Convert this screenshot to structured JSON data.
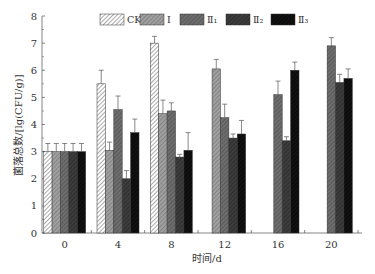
{
  "chart_data": {
    "type": "bar",
    "title": "",
    "xlabel": "时间/d",
    "ylabel": "菌落总数/[lg(CFU/g)]",
    "ylim": [
      0,
      8
    ],
    "yticks": [
      "0",
      "1",
      "2",
      "3",
      "4",
      "5",
      "6",
      "7",
      "8"
    ],
    "categories": [
      "0",
      "4",
      "8",
      "12",
      "16",
      "20"
    ],
    "legend_position": "top",
    "series": [
      {
        "name": "CK",
        "color": "#ffffff",
        "hatch": "#555555",
        "values": [
          3.0,
          5.5,
          7.0,
          null,
          null,
          null
        ],
        "errors": [
          0.3,
          0.5,
          0.25,
          null,
          null,
          null
        ]
      },
      {
        "name": "Ⅰ",
        "color": "#a0a0a0",
        "hatch": "#666666",
        "values": [
          3.0,
          3.05,
          4.4,
          6.05,
          null,
          null
        ],
        "errors": [
          0.3,
          0.3,
          0.5,
          0.35,
          null,
          null
        ]
      },
      {
        "name": "Ⅱ₁",
        "color": "#6e6e6e",
        "hatch": "#444444",
        "values": [
          3.0,
          4.55,
          4.5,
          4.25,
          5.1,
          6.9
        ],
        "errors": [
          0.3,
          0.5,
          0.3,
          0.5,
          0.5,
          0.3
        ]
      },
      {
        "name": "Ⅱ₂",
        "color": "#3c3c3c",
        "hatch": "#222222",
        "values": [
          3.0,
          2.0,
          2.8,
          3.5,
          3.4,
          5.55
        ],
        "errors": [
          0.3,
          0.3,
          0.1,
          0.15,
          0.15,
          0.3
        ]
      },
      {
        "name": "Ⅱ₃",
        "color": "#111111",
        "hatch": "#000000",
        "values": [
          3.0,
          3.7,
          3.05,
          3.65,
          6.0,
          5.7
        ],
        "errors": [
          0.3,
          0.5,
          0.65,
          0.5,
          0.3,
          0.35
        ]
      }
    ]
  }
}
